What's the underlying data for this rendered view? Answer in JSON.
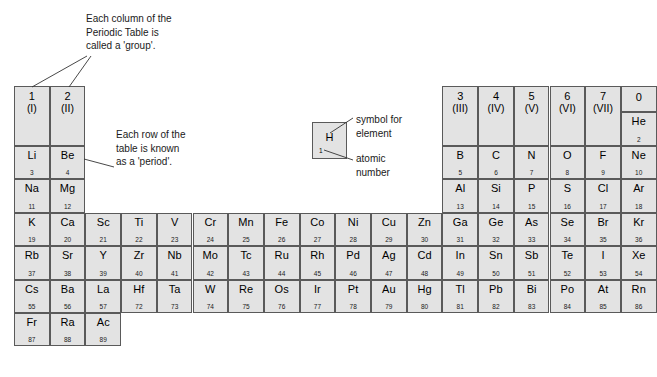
{
  "annotations": {
    "group_note": "Each column of the\nPeriodic Table is\ncalled a 'group'.",
    "period_note": "Each row of the\ntable is known\nas a 'period'.",
    "symbol_note": "symbol for\nelement",
    "atomic_note": "atomic\nnumber"
  },
  "example_cell": {
    "symbol": "H",
    "number": "1"
  },
  "group_headers": [
    {
      "col": 1,
      "number": "1",
      "roman": "(I)"
    },
    {
      "col": 2,
      "number": "2",
      "roman": "(II)"
    },
    {
      "col": 13,
      "number": "3",
      "roman": "(III)"
    },
    {
      "col": 14,
      "number": "4",
      "roman": "(IV)"
    },
    {
      "col": 15,
      "number": "5",
      "roman": "(V)"
    },
    {
      "col": 16,
      "number": "6",
      "roman": "(VI)"
    },
    {
      "col": 17,
      "number": "7",
      "roman": "(VII)"
    },
    {
      "col": 18,
      "number": "0",
      "roman": ""
    }
  ],
  "elements": [
    {
      "symbol": "He",
      "number": "2",
      "col": 18,
      "row": 1
    },
    {
      "symbol": "Li",
      "number": "3",
      "col": 1,
      "row": 2
    },
    {
      "symbol": "Be",
      "number": "4",
      "col": 2,
      "row": 2
    },
    {
      "symbol": "B",
      "number": "5",
      "col": 13,
      "row": 2
    },
    {
      "symbol": "C",
      "number": "6",
      "col": 14,
      "row": 2
    },
    {
      "symbol": "N",
      "number": "7",
      "col": 15,
      "row": 2
    },
    {
      "symbol": "O",
      "number": "8",
      "col": 16,
      "row": 2
    },
    {
      "symbol": "F",
      "number": "9",
      "col": 17,
      "row": 2
    },
    {
      "symbol": "Ne",
      "number": "10",
      "col": 18,
      "row": 2
    },
    {
      "symbol": "Na",
      "number": "11",
      "col": 1,
      "row": 3
    },
    {
      "symbol": "Mg",
      "number": "12",
      "col": 2,
      "row": 3
    },
    {
      "symbol": "Al",
      "number": "13",
      "col": 13,
      "row": 3
    },
    {
      "symbol": "Si",
      "number": "14",
      "col": 14,
      "row": 3
    },
    {
      "symbol": "P",
      "number": "15",
      "col": 15,
      "row": 3
    },
    {
      "symbol": "S",
      "number": "16",
      "col": 16,
      "row": 3
    },
    {
      "symbol": "Cl",
      "number": "17",
      "col": 17,
      "row": 3
    },
    {
      "symbol": "Ar",
      "number": "18",
      "col": 18,
      "row": 3
    },
    {
      "symbol": "K",
      "number": "19",
      "col": 1,
      "row": 4
    },
    {
      "symbol": "Ca",
      "number": "20",
      "col": 2,
      "row": 4
    },
    {
      "symbol": "Sc",
      "number": "21",
      "col": 3,
      "row": 4
    },
    {
      "symbol": "Ti",
      "number": "22",
      "col": 4,
      "row": 4
    },
    {
      "symbol": "V",
      "number": "23",
      "col": 5,
      "row": 4
    },
    {
      "symbol": "Cr",
      "number": "24",
      "col": 6,
      "row": 4
    },
    {
      "symbol": "Mn",
      "number": "25",
      "col": 7,
      "row": 4
    },
    {
      "symbol": "Fe",
      "number": "26",
      "col": 8,
      "row": 4
    },
    {
      "symbol": "Co",
      "number": "27",
      "col": 9,
      "row": 4
    },
    {
      "symbol": "Ni",
      "number": "28",
      "col": 10,
      "row": 4
    },
    {
      "symbol": "Cu",
      "number": "29",
      "col": 11,
      "row": 4
    },
    {
      "symbol": "Zn",
      "number": "30",
      "col": 12,
      "row": 4
    },
    {
      "symbol": "Ga",
      "number": "31",
      "col": 13,
      "row": 4
    },
    {
      "symbol": "Ge",
      "number": "32",
      "col": 14,
      "row": 4
    },
    {
      "symbol": "As",
      "number": "33",
      "col": 15,
      "row": 4
    },
    {
      "symbol": "Se",
      "number": "34",
      "col": 16,
      "row": 4
    },
    {
      "symbol": "Br",
      "number": "35",
      "col": 17,
      "row": 4
    },
    {
      "symbol": "Kr",
      "number": "36",
      "col": 18,
      "row": 4
    },
    {
      "symbol": "Rb",
      "number": "37",
      "col": 1,
      "row": 5
    },
    {
      "symbol": "Sr",
      "number": "38",
      "col": 2,
      "row": 5
    },
    {
      "symbol": "Y",
      "number": "39",
      "col": 3,
      "row": 5
    },
    {
      "symbol": "Zr",
      "number": "40",
      "col": 4,
      "row": 5
    },
    {
      "symbol": "Nb",
      "number": "41",
      "col": 5,
      "row": 5
    },
    {
      "symbol": "Mo",
      "number": "42",
      "col": 6,
      "row": 5
    },
    {
      "symbol": "Tc",
      "number": "43",
      "col": 7,
      "row": 5
    },
    {
      "symbol": "Ru",
      "number": "44",
      "col": 8,
      "row": 5
    },
    {
      "symbol": "Rh",
      "number": "45",
      "col": 9,
      "row": 5
    },
    {
      "symbol": "Pd",
      "number": "46",
      "col": 10,
      "row": 5
    },
    {
      "symbol": "Ag",
      "number": "47",
      "col": 11,
      "row": 5
    },
    {
      "symbol": "Cd",
      "number": "48",
      "col": 12,
      "row": 5
    },
    {
      "symbol": "In",
      "number": "49",
      "col": 13,
      "row": 5
    },
    {
      "symbol": "Sn",
      "number": "50",
      "col": 14,
      "row": 5
    },
    {
      "symbol": "Sb",
      "number": "51",
      "col": 15,
      "row": 5
    },
    {
      "symbol": "Te",
      "number": "52",
      "col": 16,
      "row": 5
    },
    {
      "symbol": "I",
      "number": "53",
      "col": 17,
      "row": 5
    },
    {
      "symbol": "Xe",
      "number": "54",
      "col": 18,
      "row": 5
    },
    {
      "symbol": "Cs",
      "number": "55",
      "col": 1,
      "row": 6
    },
    {
      "symbol": "Ba",
      "number": "56",
      "col": 2,
      "row": 6
    },
    {
      "symbol": "La",
      "number": "57",
      "col": 3,
      "row": 6
    },
    {
      "symbol": "Hf",
      "number": "72",
      "col": 4,
      "row": 6
    },
    {
      "symbol": "Ta",
      "number": "73",
      "col": 5,
      "row": 6
    },
    {
      "symbol": "W",
      "number": "74",
      "col": 6,
      "row": 6
    },
    {
      "symbol": "Re",
      "number": "75",
      "col": 7,
      "row": 6
    },
    {
      "symbol": "Os",
      "number": "76",
      "col": 8,
      "row": 6
    },
    {
      "symbol": "Ir",
      "number": "77",
      "col": 9,
      "row": 6
    },
    {
      "symbol": "Pt",
      "number": "78",
      "col": 10,
      "row": 6
    },
    {
      "symbol": "Au",
      "number": "79",
      "col": 11,
      "row": 6
    },
    {
      "symbol": "Hg",
      "number": "80",
      "col": 12,
      "row": 6
    },
    {
      "symbol": "Tl",
      "number": "81",
      "col": 13,
      "row": 6
    },
    {
      "symbol": "Pb",
      "number": "82",
      "col": 14,
      "row": 6
    },
    {
      "symbol": "Bi",
      "number": "83",
      "col": 15,
      "row": 6
    },
    {
      "symbol": "Po",
      "number": "84",
      "col": 16,
      "row": 6
    },
    {
      "symbol": "At",
      "number": "85",
      "col": 17,
      "row": 6
    },
    {
      "symbol": "Rn",
      "number": "86",
      "col": 18,
      "row": 6
    },
    {
      "symbol": "Fr",
      "number": "87",
      "col": 1,
      "row": 7
    },
    {
      "symbol": "Ra",
      "number": "88",
      "col": 2,
      "row": 7
    },
    {
      "symbol": "Ac",
      "number": "89",
      "col": 3,
      "row": 7
    }
  ],
  "colors": {
    "cell_fill": "#e3e3e3",
    "cell_border": "#5a5a5a",
    "text": "#000000",
    "background": "#ffffff"
  }
}
